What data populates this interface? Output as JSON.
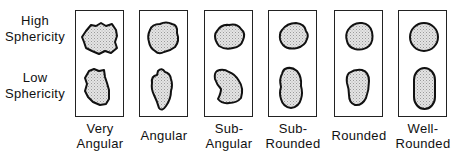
{
  "rows": [
    {
      "line1": "High",
      "line2": "Sphericity"
    },
    {
      "line1": "Low",
      "line2": "Sphericity"
    }
  ],
  "columns": [
    {
      "line1": "Very",
      "line2": "Angular"
    },
    {
      "line1": "",
      "line2": "Angular"
    },
    {
      "line1": "Sub-",
      "line2": "Angular"
    },
    {
      "line1": "Sub-",
      "line2": "Rounded"
    },
    {
      "line1": "",
      "line2": "Rounded"
    },
    {
      "line1": "Well-",
      "line2": "Rounded"
    }
  ],
  "colors": {
    "outline": "#111111",
    "fill": "#d8d8d8",
    "frame": "#222222"
  }
}
